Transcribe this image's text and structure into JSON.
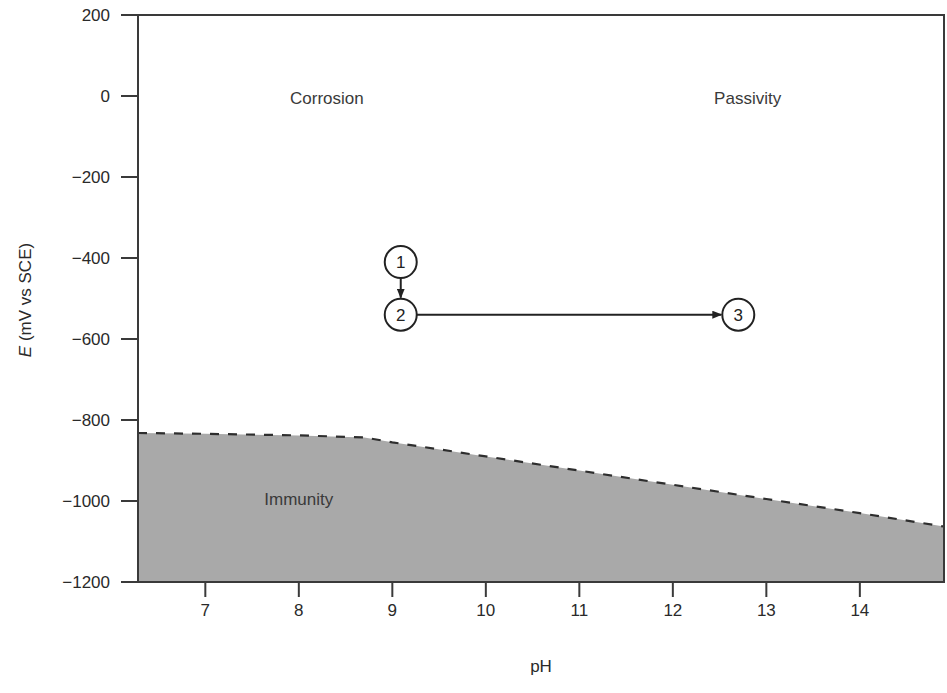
{
  "chart_data": {
    "type": "area",
    "title": "",
    "xlabel": "pH",
    "ylabel": "E (mV vs SCE)",
    "ylabel_italic_part": "E",
    "ylabel_rest": " (mV vs SCE)",
    "xlim": [
      6.28,
      14.9
    ],
    "ylim": [
      -1200,
      200
    ],
    "x_ticks": [
      7,
      8,
      9,
      10,
      11,
      12,
      13,
      14
    ],
    "x_tick_labels": [
      "7",
      "8",
      "9",
      "10",
      "11",
      "12",
      "13",
      "14"
    ],
    "y_ticks": [
      200,
      0,
      -200,
      -400,
      -600,
      -800,
      -1000,
      -1200
    ],
    "y_tick_labels": [
      "200",
      "0",
      "−200",
      "−400",
      "−600",
      "−800",
      "−1000",
      "−1200"
    ],
    "grid": false,
    "legend": null,
    "boundary": {
      "name": "Immunity boundary",
      "style": "dashed",
      "x": [
        6.28,
        7.0,
        8.0,
        8.7,
        9.0,
        10.0,
        11.0,
        12.0,
        13.0,
        14.0,
        14.9
      ],
      "y": [
        -832,
        -834,
        -838,
        -843,
        -855,
        -890,
        -925,
        -960,
        -995,
        -1030,
        -1063
      ]
    },
    "fill_region": {
      "name": "Immunity",
      "color": "#a9a9a9",
      "below": "boundary"
    },
    "regions": [
      {
        "label": "Corrosion",
        "x": 8.3,
        "y": -20
      },
      {
        "label": "Passivity",
        "x": 12.8,
        "y": -20
      },
      {
        "label": "Immunity",
        "x": 8.0,
        "y": -1010
      }
    ],
    "points": [
      {
        "label": "1",
        "x": 9.09,
        "y": -410
      },
      {
        "label": "2",
        "x": 9.09,
        "y": -540
      },
      {
        "label": "3",
        "x": 12.7,
        "y": -540
      }
    ],
    "arrows": [
      {
        "from": "1",
        "to": "2"
      },
      {
        "from": "2",
        "to": "3"
      }
    ]
  },
  "colors": {
    "axis": "#3a3a3a",
    "fill": "#a9a9a9",
    "dash": "#2e2e2e",
    "background": "#ffffff"
  }
}
